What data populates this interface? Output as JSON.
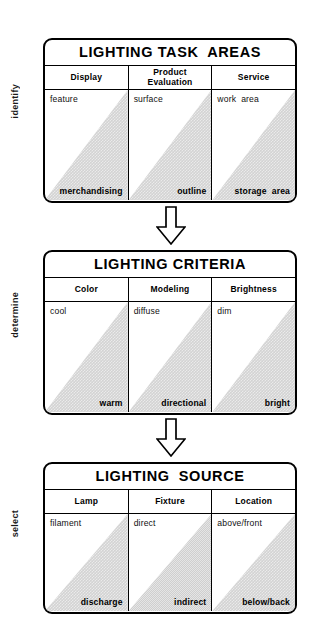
{
  "diagram": {
    "accent_color": "#000000",
    "wedge_color": "#d3d3d3",
    "arrow_icon": "down-arrow-icon"
  },
  "stages": [
    {
      "side_label": "identify",
      "panel_title": "LIGHTING TASK  AREAS",
      "columns": [
        {
          "header": "Display",
          "top": "feature",
          "bottom": "merchandising"
        },
        {
          "header": "Product\nEvaluation",
          "top": "surface",
          "bottom": "outline"
        },
        {
          "header": "Service",
          "top": "work  area",
          "bottom": "storage  area"
        }
      ]
    },
    {
      "side_label": "determine",
      "panel_title": "LIGHTING CRITERIA",
      "columns": [
        {
          "header": "Color",
          "top": "cool",
          "bottom": "warm"
        },
        {
          "header": "Modeling",
          "top": "diffuse",
          "bottom": "directional"
        },
        {
          "header": "Brightness",
          "top": "dim",
          "bottom": "bright"
        }
      ]
    },
    {
      "side_label": "select",
      "panel_title": "LIGHTING  SOURCE",
      "columns": [
        {
          "header": "Lamp",
          "top": "filament",
          "bottom": "discharge"
        },
        {
          "header": "Fixture",
          "top": "direct",
          "bottom": "indirect"
        },
        {
          "header": "Location",
          "top": "above/front",
          "bottom": "below/back"
        }
      ]
    }
  ],
  "connectors": [
    {
      "name": "arrow-stage1-to-stage2"
    },
    {
      "name": "arrow-stage2-to-stage3"
    }
  ]
}
